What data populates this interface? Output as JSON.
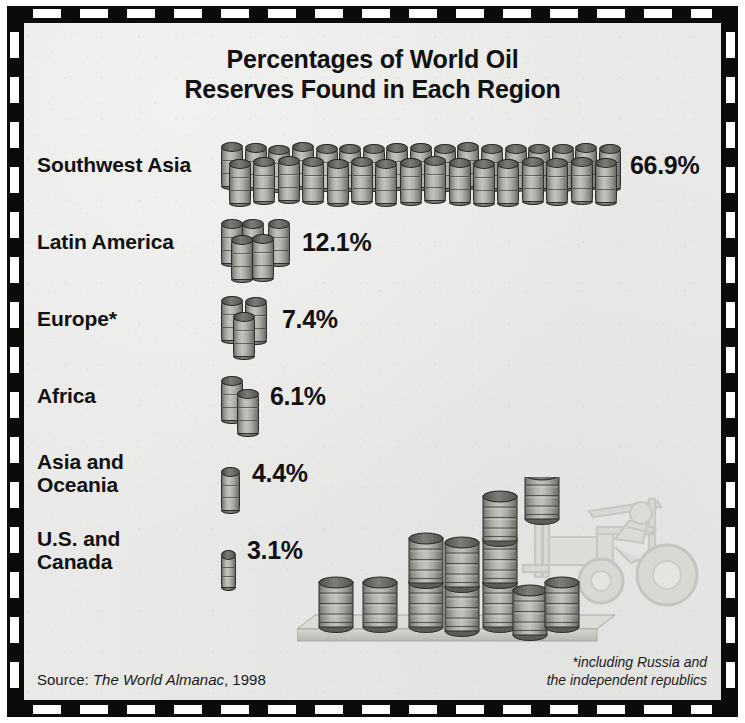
{
  "figure": {
    "title_line_1": "Percentages of World Oil",
    "title_line_2": "Reserves Found in Each Region",
    "source_prefix": "Source:",
    "source_italic": "The World Almanac",
    "source_suffix": ", 1998",
    "footnote_line_1": "*including Russia and",
    "footnote_line_2": "the independent republics",
    "background_color": "#e9e9e7",
    "frame_color": "#0b0b0b",
    "barrel_color": "#b3b3ae",
    "text_color": "#111111"
  },
  "chart_data": {
    "type": "bar",
    "title": "Percentages of World Oil Reserves Found in Each Region",
    "xlabel": "",
    "ylabel": "",
    "unit": "%",
    "pictogram": "oil-barrel",
    "categories": [
      "Southwest Asia",
      "Latin America",
      "Europe*",
      "Africa",
      "Asia and Oceania",
      "U.S. and Canada"
    ],
    "values": [
      66.9,
      12.1,
      7.4,
      6.1,
      4.4,
      3.1
    ],
    "value_labels": [
      "66.9%",
      "12.1%",
      "7.4%",
      "6.1%",
      "4.4%",
      "3.1%"
    ],
    "barrel_counts": [
      33,
      5,
      3,
      2,
      1,
      1
    ],
    "legend": [],
    "grid": false,
    "annotations": [
      "*including Russia and the independent republics",
      "Source: The World Almanac, 1998"
    ]
  },
  "rows": [
    {
      "label_line_1": "Southwest Asia",
      "label_line_2": "",
      "value": "66.9%",
      "barrel_count": 33,
      "pictogram_width": 400
    },
    {
      "label_line_1": "Latin America",
      "label_line_2": "",
      "value": "12.1%",
      "barrel_count": 5,
      "pictogram_width": 72
    },
    {
      "label_line_1": "Europe*",
      "label_line_2": "",
      "value": "7.4%",
      "barrel_count": 3,
      "pictogram_width": 52
    },
    {
      "label_line_1": "Africa",
      "label_line_2": "",
      "value": "6.1%",
      "barrel_count": 2,
      "pictogram_width": 40
    },
    {
      "label_line_1": "Asia and",
      "label_line_2": "Oceania",
      "value": "4.4%",
      "barrel_count": 1,
      "pictogram_width": 22
    },
    {
      "label_line_1": "U.S. and",
      "label_line_2": "Canada",
      "value": "3.1%",
      "barrel_count": 1,
      "pictogram_width": 17
    }
  ]
}
